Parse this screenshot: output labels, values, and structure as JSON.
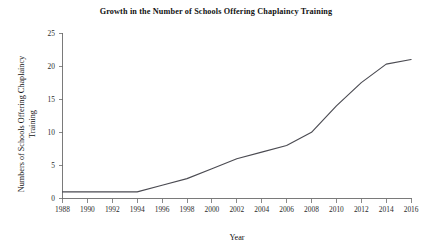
{
  "chart_data": {
    "type": "line",
    "title": "Growth in the Number of Schools Offering Chaplaincy Training",
    "xlabel": "Year",
    "ylabel": "Numbers of Schools Offering Chaplaincy Training",
    "ylabel_line1": "Numbers of Schools Offering Chaplaincy",
    "ylabel_line2": "Training",
    "grid": false,
    "legend": "none",
    "xlim": [
      1987,
      2017
    ],
    "ylim": [
      0,
      25
    ],
    "xticks": [
      1988,
      1990,
      1992,
      1994,
      1996,
      1998,
      2000,
      2002,
      2004,
      2006,
      2008,
      2010,
      2012,
      2014,
      2016
    ],
    "xtick_labels": [
      "1988",
      "1990",
      "1992",
      "1994",
      "1996",
      "1998",
      "2000",
      "2002",
      "2004",
      "2006",
      "2008",
      "2010",
      "2012",
      "2014",
      "2016"
    ],
    "yticks": [
      0,
      5,
      10,
      15,
      20,
      25
    ],
    "ytick_labels": [
      "0",
      "5",
      "10",
      "15",
      "20",
      "25"
    ],
    "line_color": "#4b4b52",
    "x": [
      1988,
      1990,
      1992,
      1994,
      1996,
      1998,
      2000,
      2002,
      2004,
      2006,
      2008,
      2010,
      2012,
      2014,
      2016
    ],
    "values": [
      1,
      1,
      1,
      1,
      2,
      3,
      4.5,
      6,
      7,
      8,
      10,
      14,
      17.5,
      20.3,
      21
    ],
    "series": [
      {
        "name": "Schools Offering Chaplaincy Training",
        "values": [
          1,
          1,
          1,
          1,
          2,
          3,
          4.5,
          6,
          7,
          8,
          10,
          14,
          17.5,
          20.3,
          21
        ]
      }
    ]
  }
}
